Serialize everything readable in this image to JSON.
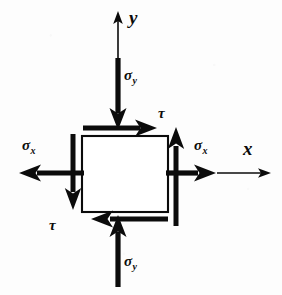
{
  "figure": {
    "type": "engineering-stress-element-diagram",
    "width": 282,
    "height": 295,
    "background_color": "#fdfdfd",
    "ink_color": "#0b0b0b"
  },
  "axes": {
    "y": {
      "label": "y",
      "direction": "up",
      "style": "thin",
      "from": [
        118,
        58
      ],
      "to": [
        118,
        14
      ]
    },
    "x": {
      "label": "x",
      "direction": "right",
      "style": "thin",
      "from": [
        218,
        173
      ],
      "to": [
        270,
        173
      ]
    }
  },
  "element": {
    "name": "stress-square",
    "left": 82,
    "top": 136,
    "width": 86,
    "height": 76,
    "stroke": "#0b0b0b",
    "stroke_width": 2,
    "fill": "#ffffff"
  },
  "stresses": [
    {
      "id": "sigma-y-top",
      "symbol": "σ",
      "subscript": "y",
      "label": "σy",
      "kind": "normal",
      "face": "top",
      "direction": "down",
      "sense": "compressive-arrow-into-element"
    },
    {
      "id": "sigma-y-bottom",
      "symbol": "σ",
      "subscript": "y",
      "label": "σy",
      "kind": "normal",
      "face": "bottom",
      "direction": "up",
      "sense": "compressive-arrow-into-element"
    },
    {
      "id": "sigma-x-left",
      "symbol": "σ",
      "subscript": "x",
      "label": "σx",
      "kind": "normal",
      "face": "left",
      "direction": "left",
      "sense": "tensile-arrow-out-of-element"
    },
    {
      "id": "sigma-x-right",
      "symbol": "σ",
      "subscript": "x",
      "label": "σx",
      "kind": "normal",
      "face": "right",
      "direction": "right",
      "sense": "tensile-arrow-out-of-element"
    },
    {
      "id": "tau-top",
      "symbol": "τ",
      "subscript": "",
      "label": "τ",
      "kind": "shear",
      "face": "top",
      "direction": "right"
    },
    {
      "id": "tau-bottom",
      "symbol": "τ",
      "subscript": "",
      "label": "τ",
      "kind": "shear",
      "face": "bottom",
      "direction": "left"
    },
    {
      "id": "tau-left",
      "symbol": "τ",
      "subscript": "",
      "label": "",
      "kind": "shear",
      "face": "left",
      "direction": "down"
    },
    {
      "id": "tau-right",
      "symbol": "τ",
      "subscript": "",
      "label": "",
      "kind": "shear",
      "face": "right",
      "direction": "up"
    }
  ],
  "labels": {
    "y_axis": "y",
    "x_axis": "x",
    "sigma": "σ",
    "tau": "τ",
    "sub_x": "x",
    "sub_y": "y"
  }
}
